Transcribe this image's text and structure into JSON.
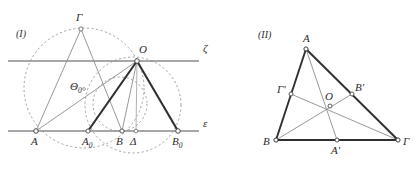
{
  "figures": [
    {
      "id": "figure-1",
      "caption": "(I)",
      "caption_pos": {
        "x": 16,
        "y": 37
      },
      "lines": {
        "zeta_label": "ζ",
        "zeta_label_pos": {
          "x": 203,
          "y": 48
        },
        "epsilon_label": "ε",
        "epsilon_label_pos": {
          "x": 203,
          "y": 124
        }
      },
      "points": [
        {
          "name": "Gamma",
          "label": "Γ",
          "sub": "",
          "x": 81,
          "y": 29,
          "lx": 76,
          "ly": 21
        },
        {
          "name": "O",
          "label": "O",
          "sub": "",
          "x": 137,
          "y": 61,
          "lx": 139,
          "ly": 53
        },
        {
          "name": "Theta0",
          "label": "Θ",
          "sub": "0",
          "x": 83,
          "y": 87,
          "lx": 74,
          "ly": 87
        },
        {
          "name": "A",
          "label": "A",
          "sub": "",
          "x": 36,
          "y": 131,
          "lx": 31,
          "ly": 144
        },
        {
          "name": "A0",
          "label": "A",
          "sub": "0",
          "x": 88,
          "y": 131,
          "lx": 82,
          "ly": 144
        },
        {
          "name": "B",
          "label": "B",
          "sub": "",
          "x": 122,
          "y": 131,
          "lx": 117,
          "ly": 144
        },
        {
          "name": "Delta",
          "label": "Δ",
          "sub": "",
          "x": 136,
          "y": 131,
          "lx": 132,
          "ly": 144
        },
        {
          "name": "B0",
          "label": "B",
          "sub": "0",
          "x": 178,
          "y": 131,
          "lx": 172,
          "ly": 144
        }
      ],
      "circles": [
        {
          "name": "circle-large-left",
          "cx": 84,
          "cy": 88,
          "r": 60
        },
        {
          "name": "circle-right",
          "cx": 133,
          "cy": 105,
          "r": 48
        },
        {
          "name": "circle-small",
          "cx": 120,
          "cy": 104,
          "r": 27
        }
      ],
      "segments_thick": [
        {
          "name": "seg-A0-O",
          "x1": 88,
          "y1": 131,
          "x2": 137,
          "y2": 61
        },
        {
          "name": "seg-O-B0",
          "x1": 137,
          "y1": 61,
          "x2": 178,
          "y2": 131
        }
      ],
      "segments_thin": [
        {
          "name": "seg-A-Gamma",
          "x1": 36,
          "y1": 131,
          "x2": 81,
          "y2": 29
        },
        {
          "name": "seg-Gamma-B",
          "x1": 81,
          "y1": 29,
          "x2": 122,
          "y2": 131
        },
        {
          "name": "seg-A-O",
          "x1": 36,
          "y1": 131,
          "x2": 137,
          "y2": 61
        },
        {
          "name": "seg-O-B",
          "x1": 137,
          "y1": 61,
          "x2": 122,
          "y2": 131
        },
        {
          "name": "seg-O-Delta",
          "x1": 137,
          "y1": 61,
          "x2": 136,
          "y2": 131
        }
      ],
      "axis_lines": [
        {
          "name": "line-zeta",
          "x1": 8,
          "y1": 61,
          "x2": 199,
          "y2": 61
        },
        {
          "name": "line-epsilon",
          "x1": 8,
          "y1": 131,
          "x2": 199,
          "y2": 131
        }
      ]
    },
    {
      "id": "figure-2",
      "caption": "(II)",
      "caption_pos": {
        "x": 258,
        "y": 38
      },
      "points": [
        {
          "name": "A",
          "label": "A",
          "sub": "",
          "prime": false,
          "x": 306,
          "y": 49,
          "lx": 303,
          "ly": 41
        },
        {
          "name": "B",
          "label": "B",
          "sub": "",
          "prime": false,
          "x": 276,
          "y": 140,
          "lx": 265,
          "ly": 144
        },
        {
          "name": "Gamma",
          "label": "Γ",
          "sub": "",
          "prime": false,
          "x": 398,
          "y": 140,
          "lx": 403,
          "ly": 144
        },
        {
          "name": "Gamma-prime",
          "label": "Γ",
          "sub": "",
          "prime": true,
          "x": 291,
          "y": 94,
          "lx": 278,
          "ly": 92
        },
        {
          "name": "B-prime",
          "label": "B",
          "sub": "",
          "prime": true,
          "x": 352,
          "y": 94,
          "lx": 355,
          "ly": 90
        },
        {
          "name": "A-prime",
          "label": "A",
          "sub": "",
          "prime": true,
          "x": 337,
          "y": 140,
          "lx": 331,
          "ly": 153
        },
        {
          "name": "O",
          "label": "O",
          "sub": "",
          "prime": false,
          "x": 330,
          "y": 106,
          "lx": 326,
          "ly": 99
        }
      ],
      "segments_thick": [
        {
          "name": "side-A-B",
          "x1": 306,
          "y1": 49,
          "x2": 276,
          "y2": 140
        },
        {
          "name": "side-A-Gamma",
          "x1": 306,
          "y1": 49,
          "x2": 398,
          "y2": 140
        },
        {
          "name": "side-B-Gamma",
          "x1": 276,
          "y1": 140,
          "x2": 398,
          "y2": 140
        }
      ],
      "segments_thin": [
        {
          "name": "median-A-Aprime",
          "x1": 306,
          "y1": 49,
          "x2": 337,
          "y2": 140
        },
        {
          "name": "median-B-Bprime",
          "x1": 276,
          "y1": 140,
          "x2": 352,
          "y2": 94
        },
        {
          "name": "median-Gamma-Gammaprime",
          "x1": 398,
          "y1": 140,
          "x2": 291,
          "y2": 94
        }
      ]
    }
  ],
  "style": {
    "stroke_dark": "#3a3a3a",
    "stroke_mid": "#8a8a8a",
    "stroke_light": "#9a9a9a",
    "dash_color": "#9a9a9a",
    "point_fill": "#ffffff",
    "background": "#ffffff"
  }
}
